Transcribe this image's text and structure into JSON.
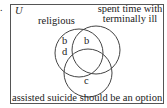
{
  "question_number": ".",
  "universe_label": "U",
  "sets": {
    "religious": "religious",
    "spent_time": [
      "spent time with",
      "terminally ill"
    ],
    "assisted": "assisted suicide should be an option"
  },
  "regions": {
    "religious_only_1": "b",
    "religious_only_2": "d",
    "religious_spent": "b",
    "assisted_only": "c"
  }
}
